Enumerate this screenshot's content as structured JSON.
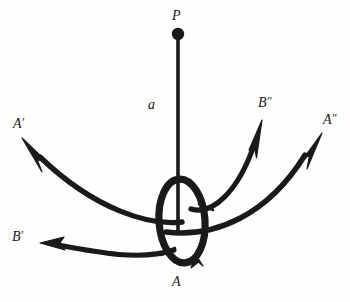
{
  "figure": {
    "type": "vector-field-diagram",
    "background_color": "#fefefe",
    "stroke_color": "#1a1a1a",
    "canvas": {
      "width": 350,
      "height": 302
    }
  },
  "labels": {
    "point_p": "P",
    "segment_a": "a",
    "loop_a": "A",
    "vector_a_prime": "A",
    "vector_a_prime_mark": "′",
    "vector_a_double_prime": "A",
    "vector_a_double_prime_mark": "″",
    "vector_b_prime": "B",
    "vector_b_prime_mark": "′",
    "vector_b_double_prime": "B",
    "vector_b_double_prime_mark": "″"
  },
  "geometry": {
    "point_p": {
      "x": 178,
      "y": 34,
      "radius": 6
    },
    "vertical_segment": {
      "x": 178,
      "y1": 34,
      "y2": 232
    },
    "loop_ellipse": {
      "cx": 182,
      "cy": 221,
      "rx": 23,
      "ry": 42,
      "rotation": -4
    },
    "loop_direction": "clockwise-from-bottom",
    "curves": [
      {
        "name": "A-prime",
        "from": {
          "x": 182,
          "y": 222
        },
        "to": {
          "x": 22,
          "y": 138
        }
      },
      {
        "name": "A-double-prime",
        "from": {
          "x": 178,
          "y": 228
        },
        "to": {
          "x": 322,
          "y": 133
        }
      },
      {
        "name": "B-prime",
        "from": {
          "x": 172,
          "y": 252
        },
        "to": {
          "x": 40,
          "y": 243
        }
      },
      {
        "name": "B-double-prime",
        "from": {
          "x": 199,
          "y": 205
        },
        "to": {
          "x": 262,
          "y": 120
        }
      }
    ]
  },
  "label_positions": {
    "point_p": {
      "x": 172,
      "y": 9
    },
    "segment_a": {
      "x": 148,
      "y": 98
    },
    "loop_a": {
      "x": 172,
      "y": 275
    },
    "vector_a_prime": {
      "x": 13,
      "y": 116
    },
    "vector_a_double_prime": {
      "x": 323,
      "y": 112
    },
    "vector_b_prime": {
      "x": 12,
      "y": 229
    },
    "vector_b_double_prime": {
      "x": 258,
      "y": 95
    }
  }
}
